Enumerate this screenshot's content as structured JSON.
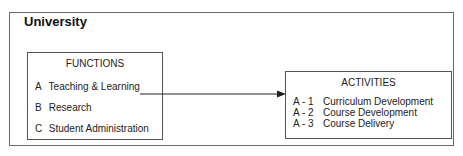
{
  "diagram": {
    "title": "University",
    "functions": {
      "title": "FUNCTIONS",
      "items": [
        {
          "code": "A",
          "label": "Teaching & Learning"
        },
        {
          "code": "B",
          "label": "Research"
        },
        {
          "code": "C",
          "label": "Student Administration"
        }
      ]
    },
    "activities": {
      "title": "ACTIVITIES",
      "items": [
        {
          "code": "A - 1",
          "label": "Curriculum Development"
        },
        {
          "code": "A - 2",
          "label": "Course Development"
        },
        {
          "code": "A - 3",
          "label": "Course Delivery"
        }
      ]
    },
    "connector": {
      "from": "A Teaching & Learning",
      "to": "ACTIVITIES"
    }
  }
}
